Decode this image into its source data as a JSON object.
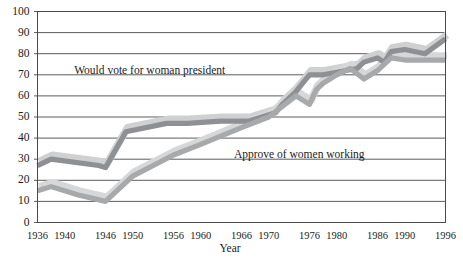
{
  "chart_data": {
    "type": "line",
    "title": "",
    "xlabel": "Year",
    "ylabel": "",
    "xlim": [
      1936,
      1996
    ],
    "ylim": [
      0,
      100
    ],
    "grid": "horizontal",
    "legend_position": "inline-annotations",
    "xtick_labels": [
      "1936",
      "1940",
      "1946",
      "1950",
      "1956",
      "1960",
      "1966",
      "1970",
      "1976",
      "1980",
      "1986",
      "1990",
      "1996"
    ],
    "xtick_values": [
      1936,
      1940,
      1946,
      1950,
      1956,
      1960,
      1966,
      1970,
      1976,
      1980,
      1986,
      1990,
      1996
    ],
    "ytick_labels": [
      "0",
      "10",
      "20",
      "30",
      "40",
      "50",
      "60",
      "70",
      "80",
      "90",
      "100"
    ],
    "ytick_values": [
      0,
      10,
      20,
      30,
      40,
      50,
      60,
      70,
      80,
      90,
      100
    ],
    "annotations": [
      {
        "text": "Would vote for woman president",
        "x": 1952.5,
        "y": 72
      },
      {
        "text": "Approve of women working",
        "x": 1974.5,
        "y": 32
      }
    ],
    "series": [
      {
        "name": "Would vote for woman president",
        "color": "#8f9093",
        "shadow_color": "#cfd0d2",
        "x": [
          1936,
          1938,
          1945,
          1946,
          1949,
          1955,
          1958,
          1963,
          1967,
          1969,
          1971,
          1972,
          1974,
          1975,
          1976,
          1978,
          1983,
          1984,
          1986,
          1987,
          1988,
          1990,
          1993,
          1996
        ],
        "y": [
          27,
          30,
          27,
          26,
          43,
          47,
          47,
          48,
          48,
          50,
          52,
          56,
          62,
          66,
          70,
          70,
          73,
          76,
          78,
          76,
          81,
          82,
          80,
          87
        ]
      },
      {
        "name": "Approve of women working",
        "color": "#a8a9ab",
        "shadow_color": "#d6d7d9",
        "x": [
          1936,
          1938,
          1942,
          1946,
          1950,
          1956,
          1960,
          1966,
          1970,
          1972,
          1974,
          1976,
          1977,
          1978,
          1980,
          1982,
          1984,
          1986,
          1988,
          1990,
          1993,
          1996
        ],
        "y": [
          15,
          17,
          13,
          10,
          22,
          32,
          37,
          45,
          50,
          55,
          60,
          56,
          63,
          66,
          70,
          73,
          68,
          72,
          78,
          77,
          77,
          77
        ]
      }
    ]
  },
  "axes": {
    "x_title": "Year"
  }
}
